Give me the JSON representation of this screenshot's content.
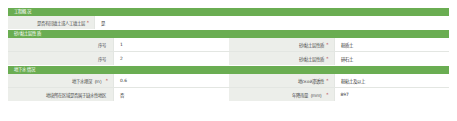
{
  "colors": {
    "header_green": "#6aad52",
    "label_gray": "#eceeea",
    "value_white": "#ffffff",
    "border": "#e3e6e2",
    "required_red": "#b94a48"
  },
  "sections": [
    {
      "title": "工程概况",
      "rows": [
        {
          "left": {
            "label": "是否有回填土或人工填土层",
            "required": "*",
            "value": "是"
          },
          "right": null
        }
      ]
    },
    {
      "title": "砂/黏土层性质",
      "rows": [
        {
          "left": {
            "label": "序号",
            "required": "",
            "value": "1"
          },
          "right": {
            "label": "砂/黏土层性质",
            "required": "*",
            "value": "粉质土"
          }
        },
        {
          "left": {
            "label": "序号",
            "required": "",
            "value": "2"
          },
          "right": {
            "label": "砂/黏土层性质",
            "required": "*",
            "value": "碎石土"
          }
        }
      ]
    },
    {
      "title": "地下水情况",
      "rows": [
        {
          "left": {
            "label": "地下水埋深（m）",
            "required": "*",
            "value": "0.6"
          },
          "right": {
            "label": "地ской渗透性",
            "required": "*",
            "value": "粉粘土及以上"
          }
        },
        {
          "left": {
            "label": "地块所在区域是否属于缺水性地区",
            "required": "",
            "value": "否"
          },
          "right": {
            "label": "年降雨量（mm）",
            "required": "*",
            "value": "897"
          }
        }
      ]
    }
  ]
}
